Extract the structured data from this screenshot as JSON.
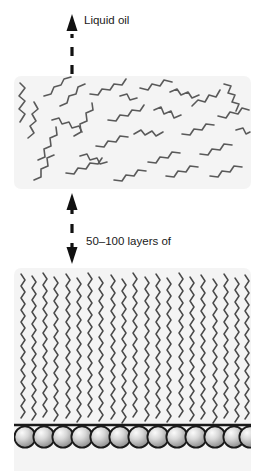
{
  "diagram": {
    "title_label": "Liquid oil",
    "annotation": {
      "line1": "50–100 layers of",
      "line2": "oil (plastic crystal)",
      "range_min": 50,
      "range_max": 100
    },
    "regions": {
      "liquid": {
        "name": "liquid-oil-region",
        "description": "randomly oriented zigzag hydrocarbon chains",
        "chain_count": 26,
        "background_color": "#f4f4f4",
        "chain_color": "#5a5a5a"
      },
      "crystal": {
        "name": "plastic-crystal-region",
        "description": "vertically aligned zigzag hydrocarbon chains",
        "chain_count": 28,
        "background_color": "#f4f4f4",
        "chain_color": "#4a4a4a"
      }
    },
    "substrate": {
      "name": "substrate-surface",
      "head_group_count": 13,
      "line_color": "#1a1a1a",
      "sphere_fill_light": "#f2f2f2",
      "sphere_fill_dark": "#8d8d8d",
      "sphere_outline": "#1a1a1a"
    },
    "arrows": {
      "evaporation": {
        "name": "evaporation-arrow",
        "direction": "up",
        "style": "dashed",
        "color": "#111111"
      },
      "thickness": {
        "name": "thickness-arrow",
        "direction": "both",
        "style": "dashed",
        "color": "#111111"
      }
    }
  }
}
